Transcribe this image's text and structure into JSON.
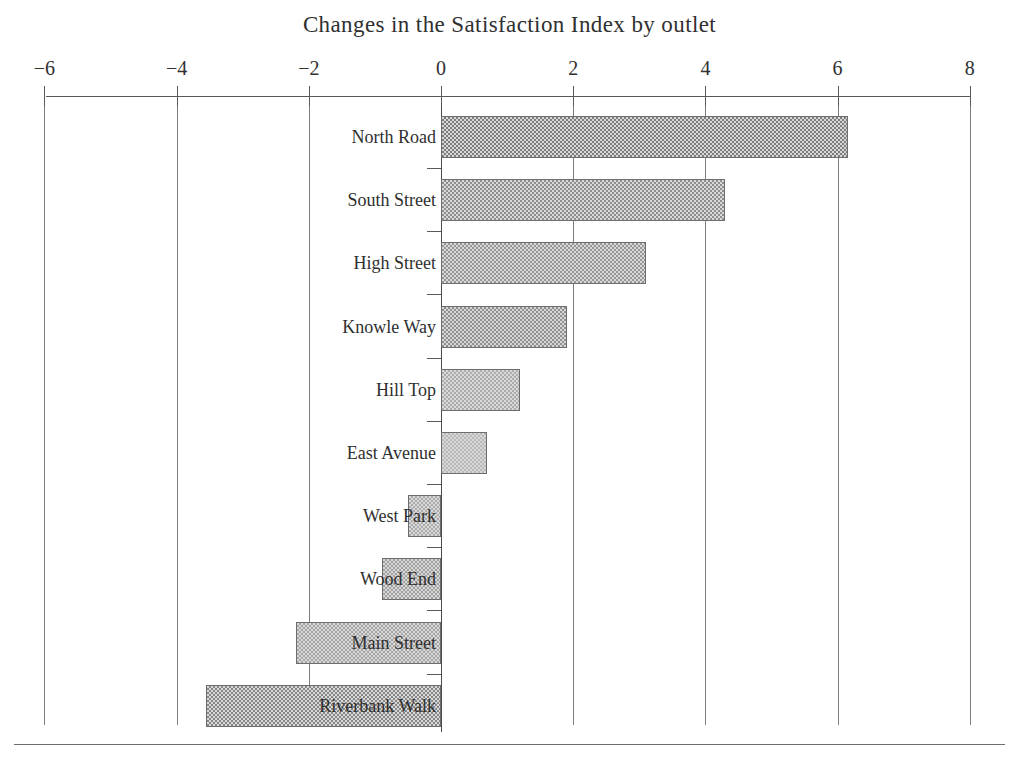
{
  "chart_data": {
    "type": "bar",
    "orientation": "horizontal",
    "title": "Changes in the Satisfaction Index by outlet",
    "xlabel": "",
    "ylabel": "",
    "xlim": [
      -6,
      8
    ],
    "xticks": [
      -6,
      -4,
      -2,
      0,
      2,
      4,
      6,
      8
    ],
    "xtick_labels": [
      "−6",
      "−4",
      "−2",
      "0",
      "2",
      "4",
      "6",
      "8"
    ],
    "grid": true,
    "legend": "none",
    "categories": [
      "North Road",
      "South Street",
      "High Street",
      "Knowle Way",
      "Hill Top",
      "East Avenue",
      "West Park",
      "Wood End",
      "Main Street",
      "Riverbank Walk"
    ],
    "values": [
      6.15,
      4.3,
      3.1,
      1.9,
      1.2,
      0.7,
      -0.5,
      -0.9,
      -2.2,
      -3.55
    ],
    "bar_fill": "#c9c9c9",
    "bar_edge": "#6d6d6d",
    "shade_levels": [
      0.62,
      0.5,
      0.44,
      0.5,
      0.3,
      0.22,
      0.3,
      0.38,
      0.34,
      0.55
    ]
  }
}
